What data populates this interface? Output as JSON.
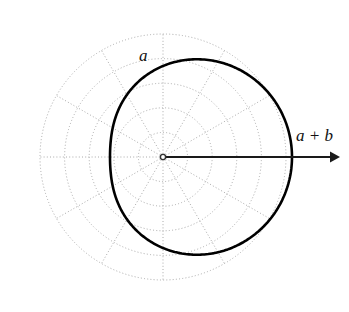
{
  "figure": {
    "background_color": "#ffffff",
    "width": 349,
    "height": 312
  },
  "labels": {
    "inner_label": "a",
    "radius_label": "a + b"
  },
  "colors": {
    "curve": "#000000",
    "grid": "#aaaaaa",
    "arrow": "#1a1a1a",
    "label": "#111111"
  },
  "chart_data": {
    "type": "line",
    "coordinate_system": "polar",
    "curve_equation": "r = a + b*cos(theta)",
    "parameters": {
      "a": 91,
      "b": 38,
      "a_plus_b": 129,
      "a_minus_b": 53
    },
    "center_px": [
      163,
      157
    ],
    "grid": {
      "visible": true,
      "style": "dotted",
      "radial_rings": 5,
      "ring_radii_px": [
        24.6,
        49.2,
        73.8,
        98.4,
        123
      ],
      "outer_radius_px": 123,
      "spoke_count": 12,
      "spoke_step_degrees": 30,
      "spoke_angles_degrees": [
        0,
        30,
        60,
        90,
        120,
        150,
        180,
        210,
        240,
        270,
        300,
        330
      ]
    },
    "arrow": {
      "from_px": [
        163,
        157
      ],
      "to_px": [
        340,
        157
      ],
      "direction_degrees": 0,
      "label": "a + b"
    },
    "annotations": [
      {
        "text": "a",
        "angle_degrees": 90,
        "note": "inner radius label near top of curve"
      },
      {
        "text": "a + b",
        "angle_degrees": 0,
        "note": "maximum radius along positive x axis"
      }
    ],
    "theta_samples_degrees": [
      0,
      15,
      30,
      45,
      60,
      75,
      90,
      105,
      120,
      135,
      150,
      165,
      180,
      195,
      210,
      225,
      240,
      255,
      270,
      285,
      300,
      315,
      330,
      345,
      360
    ],
    "r_values_px": [
      129,
      127.7,
      123.9,
      117.9,
      110,
      100.8,
      91,
      81.2,
      72,
      64.1,
      58.1,
      54.3,
      53,
      54.3,
      58.1,
      64.1,
      72,
      81.2,
      91,
      100.8,
      110,
      117.9,
      123.9,
      127.7,
      129
    ],
    "xlabel": "",
    "ylabel": "",
    "legend": []
  }
}
